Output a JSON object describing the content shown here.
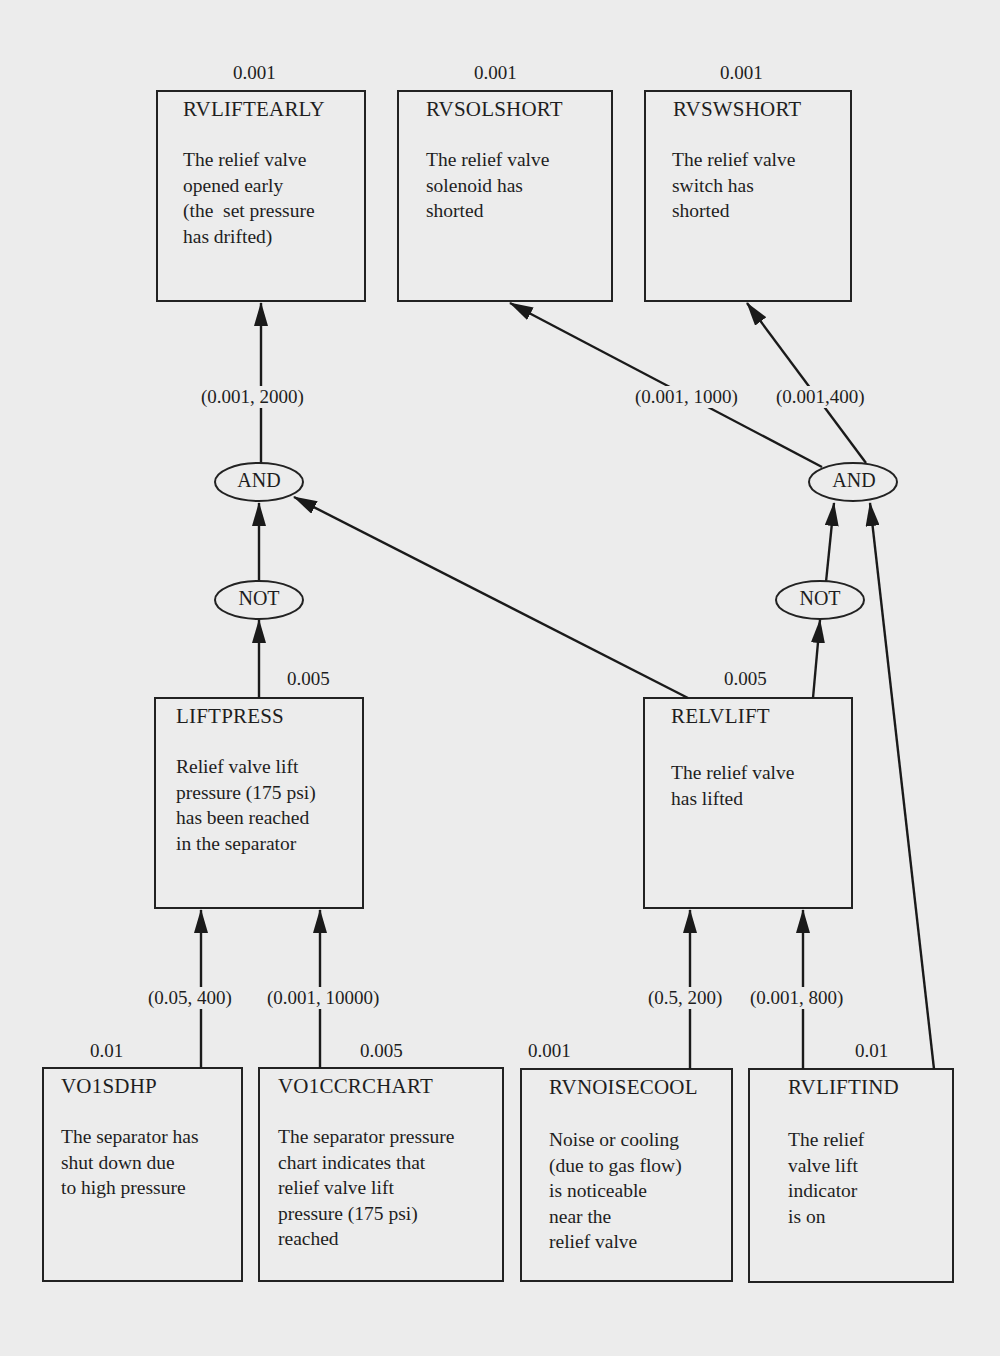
{
  "nodes": {
    "rvliftearly": {
      "name": "RVLIFTEARLY",
      "prob": "0.001",
      "desc": "The relief valve\nopened early\n(the  set pressure\nhas drifted)"
    },
    "rvsolshort": {
      "name": "RVSOLSHORT",
      "prob": "0.001",
      "desc": "The relief valve\nsolenoid has\nshorted"
    },
    "rvswshort": {
      "name": "RVSWSHORT",
      "prob": "0.001",
      "desc": "The relief valve\nswitch has\nshorted"
    },
    "liftpress": {
      "name": "LIFTPRESS",
      "prob": "0.005",
      "desc": "Relief valve lift\npressure (175 psi)\nhas been reached\nin the separator"
    },
    "relvlift": {
      "name": "RELVLIFT",
      "prob": "0.005",
      "desc": "The relief valve\nhas lifted"
    },
    "vo1sdhp": {
      "name": "VO1SDHP",
      "prob": "0.01",
      "desc": "The separator has\nshut down due\nto high pressure"
    },
    "vo1ccrchart": {
      "name": "VO1CCRCHART",
      "prob": "0.005",
      "desc": "The separator pressure\nchart indicates that\nrelief valve lift\npressure (175 psi)\nreached"
    },
    "rvnoisecool": {
      "name": "RVNOISECOOL",
      "prob": "0.001",
      "desc": "Noise or cooling\n(due to gas flow)\nis noticeable\nnear the\nrelief valve"
    },
    "rvliftind": {
      "name": "RVLIFTIND",
      "prob": "0.01",
      "desc": "The relief\nvalve lift\nindicator\nis on"
    }
  },
  "gates": {
    "and_left": "AND",
    "and_right": "AND",
    "not_left": "NOT",
    "not_right": "NOT"
  },
  "edge_labels": {
    "and_left_to_rvliftearly": "(0.001, 2000)",
    "and_right_to_rvsolshort": "(0.001, 1000)",
    "and_right_to_rvswshort": "(0.001,400)",
    "vo1sdhp_to_liftpress": "(0.05, 400)",
    "vo1ccrchart_to_liftpress": "(0.001, 10000)",
    "rvnoisecool_to_relvlift": "(0.5, 200)",
    "rvliftind_to_relvlift": "(0.001, 800)"
  },
  "edges": [
    {
      "from": "LIFTPRESS",
      "to": "NOT (left)"
    },
    {
      "from": "NOT (left)",
      "to": "AND (left)"
    },
    {
      "from": "RELVLIFT",
      "to": "AND (left)"
    },
    {
      "from": "AND (left)",
      "to": "RVLIFTEARLY",
      "params": "(0.001, 2000)"
    },
    {
      "from": "RELVLIFT",
      "to": "NOT (right)"
    },
    {
      "from": "NOT (right)",
      "to": "AND (right)"
    },
    {
      "from": "RVLIFTIND",
      "to": "AND (right)"
    },
    {
      "from": "AND (right)",
      "to": "RVSOLSHORT",
      "params": "(0.001, 1000)"
    },
    {
      "from": "AND (right)",
      "to": "RVSWSHORT",
      "params": "(0.001,400)"
    },
    {
      "from": "VO1SDHP",
      "to": "LIFTPRESS",
      "params": "(0.05, 400)"
    },
    {
      "from": "VO1CCRCHART",
      "to": "LIFTPRESS",
      "params": "(0.001, 10000)"
    },
    {
      "from": "RVNOISECOOL",
      "to": "RELVLIFT",
      "params": "(0.5, 200)"
    },
    {
      "from": "RVLIFTIND",
      "to": "RELVLIFT",
      "params": "(0.001, 800)"
    }
  ]
}
